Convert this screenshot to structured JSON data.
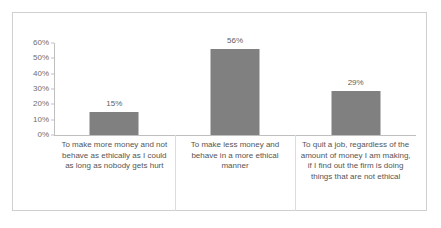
{
  "chart_data": {
    "type": "bar",
    "title": "",
    "subtitle": "",
    "xlabel": "",
    "ylabel": "",
    "ylim": [
      0,
      60
    ],
    "grid": false,
    "legend": null,
    "legend_position": "none",
    "orientation": "vertical",
    "categories": [
      "To make more money and not behave as ethically as  I could as long as nobody gets hurt",
      "To make less money and behave in a more ethical manner",
      "To quit a job, regardless of the amount of money I am making, if I find out the firm is doing things that are not ethical"
    ],
    "values": [
      15,
      56,
      29
    ],
    "data_labels": [
      "15%",
      "56%",
      "29%"
    ],
    "ytick_labels": [
      "60%",
      "50%",
      "40%",
      "30%",
      "20%",
      "10%",
      "0%"
    ],
    "ytick_values": [
      60,
      50,
      40,
      30,
      20,
      10,
      0
    ],
    "bar_color": "#808080",
    "axis_color": "#bfbfbf",
    "border_color": "#cfcfcf",
    "label_color": "#555555",
    "tick_label_color": "#6e6e6e"
  }
}
